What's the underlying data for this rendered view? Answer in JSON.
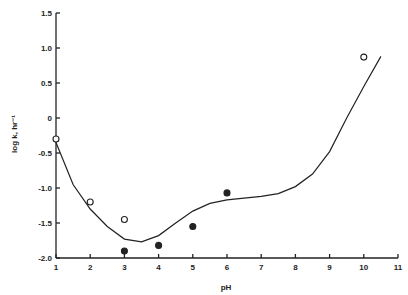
{
  "chart_data": {
    "type": "scatter",
    "title": "",
    "xlabel": "pH",
    "ylabel": "log k, hr⁻¹",
    "xlim": [
      1,
      11
    ],
    "ylim": [
      -2.0,
      1.5
    ],
    "xticks": [
      "1",
      "2",
      "3",
      "4",
      "5",
      "6",
      "7",
      "8",
      "9",
      "10",
      "11"
    ],
    "yticks": [
      "1.5",
      "1.0",
      "0.5",
      "0",
      "-0.5",
      "-1.0",
      "-1.5",
      "-2.0"
    ],
    "grid": false,
    "series": [
      {
        "name": "open circles",
        "marker": "open-circle",
        "x": [
          1,
          2,
          3,
          10
        ],
        "y": [
          -0.3,
          -1.2,
          -1.45,
          0.87
        ]
      },
      {
        "name": "filled circles",
        "marker": "filled-circle",
        "x": [
          3,
          4,
          5,
          6
        ],
        "y": [
          -1.9,
          -1.82,
          -1.55,
          -1.07
        ]
      },
      {
        "name": "fitted curve",
        "marker": "line",
        "x": [
          1,
          1.5,
          2,
          2.5,
          3,
          3.5,
          4,
          4.5,
          5,
          5.5,
          6,
          7,
          7.5,
          8,
          8.5,
          9,
          9.5,
          10,
          10.5
        ],
        "y": [
          -0.35,
          -0.95,
          -1.3,
          -1.55,
          -1.73,
          -1.77,
          -1.68,
          -1.5,
          -1.33,
          -1.22,
          -1.17,
          -1.12,
          -1.08,
          -0.98,
          -0.8,
          -0.48,
          0.0,
          0.45,
          0.88
        ]
      }
    ]
  }
}
